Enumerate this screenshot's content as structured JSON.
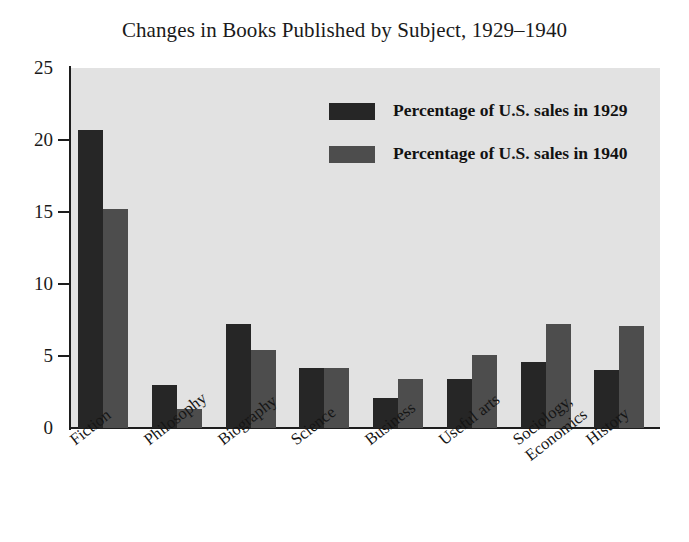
{
  "chart_data": {
    "type": "bar",
    "title": "Changes in Books Published by Subject, 1929–1940",
    "xlabel": "",
    "ylabel": "",
    "ylim": [
      0,
      25
    ],
    "yticks": [
      0,
      5,
      10,
      15,
      20,
      25
    ],
    "ytick_labels": [
      "0",
      "5",
      "10",
      "15",
      "20",
      "25"
    ],
    "grid": false,
    "legend_position": "upper center-right inside plot",
    "categories": [
      "Fiction",
      "Philosophy",
      "Biography",
      "Science",
      "Business",
      "Useful arts",
      "Sociology, Economics",
      "History"
    ],
    "category_lines": [
      [
        "Fiction"
      ],
      [
        "Philosophy"
      ],
      [
        "Biography"
      ],
      [
        "Science"
      ],
      [
        "Business"
      ],
      [
        "Useful arts"
      ],
      [
        "Sociology,",
        "Economics"
      ],
      [
        "History"
      ]
    ],
    "series": [
      {
        "name": "Percentage of U.S. sales in 1929",
        "color": "#262626",
        "values": [
          20.7,
          3.0,
          7.2,
          4.2,
          2.1,
          3.4,
          4.6,
          4.0
        ]
      },
      {
        "name": "Percentage of U.S. sales in 1940",
        "color": "#4d4d4d",
        "values": [
          15.2,
          1.3,
          5.4,
          4.2,
          3.4,
          5.1,
          7.2,
          7.1
        ]
      }
    ]
  },
  "legend": {
    "entries": [
      {
        "label": "Percentage of U.S. sales in 1929",
        "color": "#262626"
      },
      {
        "label": "Percentage of U.S. sales in 1940",
        "color": "#4d4d4d"
      }
    ]
  },
  "colors": {
    "plot_background": "#e2e2e2",
    "page_background": "#ffffff",
    "axis": "#1d1d1d",
    "series_1929": "#262626",
    "series_1940": "#4d4d4d",
    "text": "#151515"
  }
}
